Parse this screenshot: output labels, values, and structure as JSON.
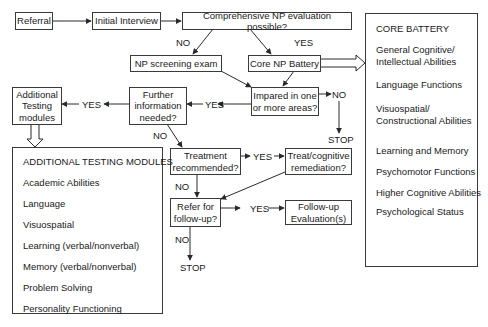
{
  "nodes": {
    "referral": "Referral",
    "initial_interview": "Initial Interview",
    "comprehensive": "Comprehensive NP evaluation possible?",
    "np_screening": "NP screening exam",
    "core_np_battery": "Core NP Battery",
    "impaired_line1": "Impared in one",
    "impaired_line2": "or more areas?",
    "further_line1": "Further",
    "further_line2": "information",
    "further_line3": "needed?",
    "additional_line1": "Additional",
    "additional_line2": "Testing",
    "additional_line3": "modules",
    "treatment_line1": "Treatment",
    "treatment_line2": "recommended?",
    "treat_line1": "Treat/cognitive",
    "treat_line2": "remediation?",
    "refer_line1": "Refer for",
    "refer_line2": "follow-up?",
    "followup_line1": "Follow-up",
    "followup_line2": "Evaluation(s)"
  },
  "edge_labels": {
    "comp_no": "NO",
    "comp_yes": "YES",
    "impaired_yes": "YES",
    "impaired_no": "NO",
    "impaired_stop": "STOP",
    "further_yes": "YES",
    "further_no": "NO",
    "treatment_yes": "YES",
    "treatment_no": "NO",
    "refer_yes": "YES",
    "refer_no": "NO",
    "refer_stop": "STOP"
  },
  "core_battery": {
    "title": "CORE BATTERY",
    "items": [
      "General Cognitive/",
      "Intellectual Abilities",
      "Language Functions",
      "Visuospatial/",
      "Constructional Abilities",
      "Learning and Memory",
      "Psychomotor Functions",
      "Higher Cognitive Abilities",
      "Psychological Status"
    ]
  },
  "additional_modules": {
    "title": "ADDITIONAL TESTING MODULES",
    "items": [
      "Academic Abilities",
      "Language",
      "Visuospatial",
      "Learning (verbal/nonverbal)",
      "Memory (verbal/nonverbal)",
      "Problem Solving",
      "Personality Functioning"
    ]
  },
  "colors": {
    "line": "#2a2a2a",
    "background": "#ffffff",
    "text": "#1a1a1a"
  }
}
